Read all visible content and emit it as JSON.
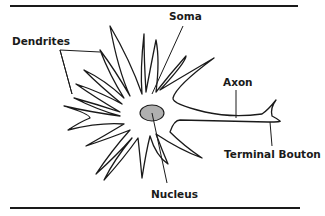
{
  "diagram": {
    "labels": {
      "soma": "Soma",
      "dendrites": "Dendrites",
      "axon": "Axon",
      "terminal_bouton": "Terminal Bouton",
      "nucleus": "Nucleus"
    },
    "colors": {
      "ink": "#1a1a1a",
      "nucleus_fill": "#b0b0b0",
      "background": "#ffffff"
    }
  }
}
